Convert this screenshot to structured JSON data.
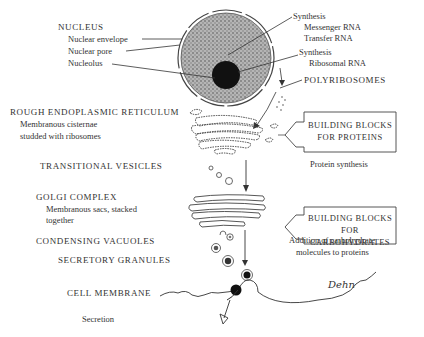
{
  "diagram": {
    "type": "biological-process",
    "left_labels": {
      "nucleus": {
        "title": "NUCLEUS",
        "items": [
          "Nuclear envelope",
          "Nuclear pore",
          "Nucleolus"
        ]
      },
      "rer": {
        "title": "ROUGH ENDOPLASMIC RETICULUM",
        "desc_line1": "Membranous cisternae",
        "desc_line2": "studded with ribosomes"
      },
      "transitional": {
        "title": "TRANSITIONAL VESICLES"
      },
      "golgi": {
        "title": "GOLGI COMPLEX",
        "desc_line1": "Membranous sacs, stacked",
        "desc_line2": "together"
      },
      "condensing": {
        "title": "CONDENSING VACUOLES"
      },
      "secretory": {
        "title": "SECRETORY GRANULES"
      },
      "membrane": {
        "title": "CELL MEMBRANE"
      },
      "secretion": {
        "title": "Secretion"
      }
    },
    "right_labels": {
      "synth_mrna": {
        "title": "Synthesis",
        "line1": "Messenger RNA",
        "line2": "Transfer RNA"
      },
      "synth_rrna": {
        "title": "Synthesis",
        "line1": "Ribosomal RNA"
      },
      "polyribosomes": {
        "title": "POLYRIBOSOMES"
      },
      "box_proteins": {
        "line1": "BUILDING BLOCKS",
        "line2": "FOR PROTEINS"
      },
      "protein_synthesis": {
        "title": "Protein synthesis"
      },
      "box_carbs": {
        "line1": "BUILDING BLOCKS FOR",
        "line2": "CARBOHYDRATES"
      },
      "carb_addition": {
        "line1": "Addition of carbohydrate",
        "line2": "molecules to proteins"
      }
    },
    "signature": "Dehn",
    "colors": {
      "ink": "#333333",
      "nucleus_fill": "#9a9a9a",
      "nucleolus": "#111111",
      "background": "#ffffff"
    }
  }
}
